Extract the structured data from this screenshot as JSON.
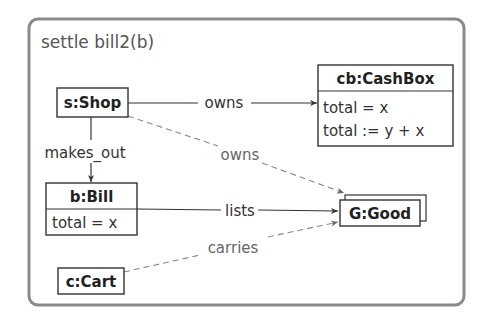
{
  "diagram": {
    "title": "settle bill2(b)",
    "colors": {
      "frame": "#8a8a8a",
      "box_border": "#333333",
      "solid_edge": "#333333",
      "dashed_edge": "#888888"
    },
    "nodes": {
      "shop": {
        "label": "s:Shop"
      },
      "cashbox": {
        "label": "cb:CashBox",
        "attributes": [
          "total = x",
          "total := y + x"
        ]
      },
      "bill": {
        "label": "b:Bill",
        "attributes": [
          "total = x"
        ]
      },
      "cart": {
        "label": "c:Cart"
      },
      "good": {
        "label": "G:Good",
        "multi": true
      }
    },
    "edges": {
      "shop_owns_cashbox": {
        "label": "owns",
        "style": "solid"
      },
      "shop_makes_out_bill": {
        "label": "makes_out",
        "style": "solid"
      },
      "shop_owns_good": {
        "label": "owns",
        "style": "dashed"
      },
      "bill_lists_good": {
        "label": "lists",
        "style": "solid"
      },
      "cart_carries_good": {
        "label": "carries",
        "style": "dashed"
      }
    }
  }
}
